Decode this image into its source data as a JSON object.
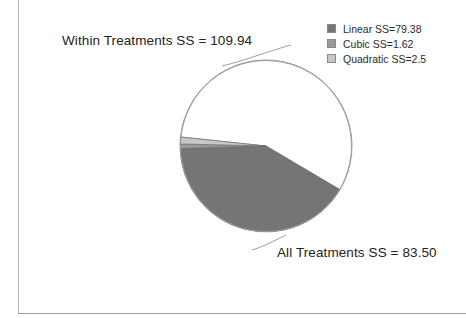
{
  "figure": {
    "background_color": "#ffffff",
    "frame_color": "#b3b3b3"
  },
  "labels": {
    "within_treatments": "Within Treatments SS = 109.94",
    "all_treatments": "All Treatments SS = 83.50"
  },
  "legend": {
    "position": "top-right",
    "items": [
      {
        "label": "Linear SS=79.38",
        "color": "#757575",
        "name": "legend-item-linear"
      },
      {
        "label": "Cubic SS=1.62",
        "color": "#9a9a9a",
        "name": "legend-item-cubic"
      },
      {
        "label": "Quadratic SS=2.5",
        "color": "#c8c8c8",
        "name": "legend-item-quadratic"
      }
    ]
  },
  "chart_data": {
    "type": "pie",
    "title": "",
    "categories": [
      "Within Treatments",
      "Linear",
      "Cubic",
      "Quadratic"
    ],
    "values": [
      109.94,
      79.38,
      1.62,
      2.5
    ],
    "total": 193.44,
    "colors": [
      "#ffffff",
      "#757575",
      "#9a9a9a",
      "#c8c8c8"
    ],
    "labels_shown": [
      "Within Treatments SS = 109.94",
      "All Treatments SS = 83.50"
    ],
    "legend_entries": [
      "Linear SS=79.38",
      "Cubic SS=1.62",
      "Quadratic SS=2.5"
    ],
    "start_angle_deg": 186,
    "direction": "clockwise",
    "center_px": [
      266,
      146
    ],
    "radius_px": 86,
    "grid": false,
    "legend_position": "top-right"
  }
}
